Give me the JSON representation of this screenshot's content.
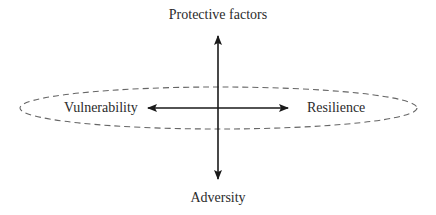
{
  "diagram": {
    "labels": {
      "top": "Protective factors",
      "bottom": "Adversity",
      "left": "Vulnerability",
      "right": "Resilience"
    },
    "axes": {
      "vertical": {
        "direction": "bidirectional",
        "ends": [
          "Protective factors",
          "Adversity"
        ]
      },
      "horizontal": {
        "direction": "bidirectional",
        "ends": [
          "Vulnerability",
          "Resilience"
        ]
      }
    },
    "ellipse": {
      "style": "dashed",
      "encloses": [
        "Vulnerability",
        "Resilience"
      ]
    },
    "colors": {
      "line": "#1a1a1a",
      "dashed": "#666666",
      "text": "#2b2b2b",
      "background": "#ffffff"
    }
  }
}
